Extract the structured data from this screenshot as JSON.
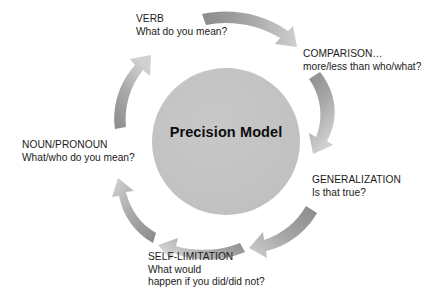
{
  "diagram": {
    "title": "Precision Model",
    "center_label": "Precision Model",
    "colors": {
      "circle_fill": "#c3c3c3",
      "arrow_dark": "#8d8d8d",
      "arrow_light": "#c9c9c9",
      "text": "#1b1b1b",
      "background": "#ffffff"
    },
    "nodes": [
      {
        "id": "verb",
        "heading": "VERB",
        "question": "What do you mean?",
        "position": "top"
      },
      {
        "id": "comparison",
        "heading": "COMPARISON…",
        "question": "more/less than who/what?",
        "position": "top-right"
      },
      {
        "id": "generalization",
        "heading": "GENERALIZATION",
        "question": "Is that true?",
        "position": "bottom-right"
      },
      {
        "id": "self-limitation",
        "heading": "SELF-LIMITATION",
        "question": "What would",
        "question_line2": "happen if you did/did not?",
        "position": "bottom"
      },
      {
        "id": "noun-pronoun",
        "heading": "NOUN/PRONOUN",
        "question": "What/who do you mean?",
        "position": "left"
      }
    ],
    "arrows": [
      {
        "id": "arrow-top",
        "name": "curved-arrow-top"
      },
      {
        "id": "arrow-top-right",
        "name": "curved-arrow-top-right"
      },
      {
        "id": "arrow-bottom-right",
        "name": "curved-arrow-bottom-right"
      },
      {
        "id": "arrow-bottom",
        "name": "curved-arrow-bottom"
      },
      {
        "id": "arrow-bottom-left",
        "name": "curved-arrow-bottom-left"
      },
      {
        "id": "arrow-top-left",
        "name": "curved-arrow-top-left"
      }
    ]
  }
}
